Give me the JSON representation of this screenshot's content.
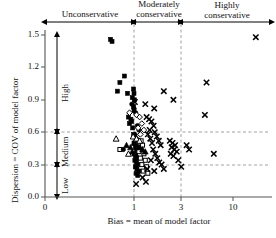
{
  "chart_data": {
    "type": "scatter",
    "title": "",
    "xlabel": "Bias = mean of model factor",
    "ylabel": "Dispersion = COV of model factor",
    "xscale": "log",
    "xticks": [
      0,
      1,
      3,
      10
    ],
    "xticklabels": [
      "0",
      "1",
      "3",
      "10"
    ],
    "yticks": [
      0.0,
      0.3,
      0.6,
      0.9,
      1.2,
      1.5
    ],
    "yticklabels": [
      "0.0",
      "0.3",
      "0.6",
      "0.9",
      "1.2",
      "1.5"
    ],
    "xlim": [
      0.35,
      20
    ],
    "ylim": [
      0.0,
      1.5
    ],
    "grid": "dashed gridlines at y=0.3, y=0.6 and x=1, x=3",
    "gridlines_x": [
      1,
      3
    ],
    "gridlines_y": [
      0.3,
      0.6
    ],
    "legend": "none",
    "zones_x": [
      {
        "label": "Unconservative",
        "range": [
          0.35,
          1
        ],
        "arrow": "double"
      },
      {
        "label": "Moderately\nconservative",
        "range": [
          1,
          3
        ],
        "arrow": "double"
      },
      {
        "label": "Highly\nconservative",
        "range": [
          3,
          20
        ],
        "arrow": "double"
      }
    ],
    "zones_y": [
      {
        "label": "Low",
        "range": [
          0.0,
          0.3
        ],
        "arrow": "double"
      },
      {
        "label": "Medium",
        "range": [
          0.3,
          0.6
        ],
        "arrow": "double"
      },
      {
        "label": "High",
        "range": [
          0.6,
          1.5
        ],
        "arrow": "double"
      }
    ],
    "series": [
      {
        "name": "filled-square",
        "marker": "filled-square",
        "points": [
          [
            0.58,
            1.46
          ],
          [
            0.6,
            1.44
          ],
          [
            0.72,
            1.06
          ],
          [
            0.8,
            1.12
          ],
          [
            0.68,
            0.98
          ],
          [
            0.86,
            0.96
          ],
          [
            0.96,
            0.92
          ],
          [
            0.99,
            1.0
          ],
          [
            1.0,
            0.96
          ],
          [
            1.01,
            0.9
          ],
          [
            0.99,
            0.84
          ],
          [
            1.0,
            0.8
          ],
          [
            0.88,
            0.74
          ],
          [
            0.93,
            0.72
          ],
          [
            0.95,
            0.7
          ],
          [
            0.9,
            0.68
          ],
          [
            0.97,
            0.64
          ],
          [
            0.99,
            0.58
          ],
          [
            1.02,
            0.56
          ],
          [
            1.05,
            0.52
          ],
          [
            1.0,
            0.5
          ],
          [
            1.03,
            0.46
          ],
          [
            1.06,
            0.44
          ],
          [
            1.0,
            0.4
          ],
          [
            1.04,
            0.38
          ],
          [
            1.08,
            0.36
          ],
          [
            1.02,
            0.34
          ],
          [
            1.06,
            0.32
          ],
          [
            1.1,
            0.3
          ],
          [
            1.03,
            0.28
          ],
          [
            1.07,
            0.26
          ],
          [
            1.12,
            0.24
          ],
          [
            1.05,
            0.22
          ],
          [
            1.09,
            0.2
          ]
        ]
      },
      {
        "name": "open-square",
        "marker": "open-square",
        "points": [
          [
            0.72,
            0.44
          ],
          [
            1.18,
            0.52
          ],
          [
            1.22,
            0.48
          ],
          [
            1.12,
            0.42
          ],
          [
            1.26,
            0.4
          ],
          [
            1.16,
            0.36
          ],
          [
            1.3,
            0.34
          ],
          [
            1.2,
            0.3
          ],
          [
            1.34,
            0.28
          ],
          [
            1.24,
            0.24
          ],
          [
            1.38,
            0.22
          ]
        ]
      },
      {
        "name": "filled-circle",
        "marker": "filled-circle",
        "points": [
          [
            0.95,
            0.86
          ],
          [
            1.0,
            0.82
          ],
          [
            1.04,
            0.78
          ],
          [
            0.78,
            0.44
          ],
          [
            1.08,
            0.66
          ],
          [
            1.12,
            0.62
          ],
          [
            1.02,
            0.58
          ],
          [
            1.06,
            0.54
          ]
        ]
      },
      {
        "name": "open-diamond",
        "marker": "open-diamond",
        "points": [
          [
            0.9,
            0.78
          ],
          [
            1.06,
            0.76
          ],
          [
            1.14,
            0.74
          ],
          [
            1.2,
            0.68
          ],
          [
            1.1,
            0.64
          ],
          [
            1.26,
            0.62
          ],
          [
            1.16,
            0.58
          ]
        ]
      },
      {
        "name": "filled-triangle",
        "marker": "filled-triangle",
        "points": [
          [
            0.84,
            0.48
          ],
          [
            0.92,
            0.46
          ],
          [
            1.0,
            0.5
          ],
          [
            1.08,
            0.48
          ],
          [
            1.14,
            0.46
          ],
          [
            1.22,
            0.44
          ],
          [
            1.3,
            0.42
          ],
          [
            0.96,
            0.42
          ],
          [
            1.04,
            0.4
          ]
        ]
      },
      {
        "name": "open-triangle",
        "marker": "open-triangle",
        "points": [
          [
            0.66,
            0.54
          ],
          [
            0.98,
            0.56
          ],
          [
            1.06,
            0.54
          ],
          [
            1.14,
            0.52
          ],
          [
            0.88,
            0.4
          ]
        ]
      },
      {
        "name": "x-marker",
        "marker": "x",
        "points": [
          [
            17.0,
            1.48
          ],
          [
            5.4,
            1.06
          ],
          [
            2.0,
            0.98
          ],
          [
            2.5,
            0.9
          ],
          [
            1.3,
            0.86
          ],
          [
            1.6,
            0.82
          ],
          [
            5.2,
            0.76
          ],
          [
            1.02,
            0.88
          ],
          [
            1.34,
            0.74
          ],
          [
            1.42,
            0.72
          ],
          [
            1.5,
            0.7
          ],
          [
            1.58,
            0.66
          ],
          [
            1.44,
            0.62
          ],
          [
            1.62,
            0.6
          ],
          [
            1.38,
            0.58
          ],
          [
            1.7,
            0.56
          ],
          [
            1.46,
            0.54
          ],
          [
            1.78,
            0.52
          ],
          [
            1.52,
            0.5
          ],
          [
            1.86,
            0.48
          ],
          [
            2.3,
            0.52
          ],
          [
            2.45,
            0.5
          ],
          [
            2.6,
            0.48
          ],
          [
            2.4,
            0.46
          ],
          [
            2.55,
            0.44
          ],
          [
            2.7,
            0.42
          ],
          [
            2.35,
            0.4
          ],
          [
            2.5,
            0.38
          ],
          [
            1.56,
            0.44
          ],
          [
            1.64,
            0.4
          ],
          [
            1.72,
            0.36
          ],
          [
            1.48,
            0.34
          ],
          [
            1.8,
            0.32
          ],
          [
            1.9,
            0.3
          ],
          [
            1.36,
            0.26
          ],
          [
            1.6,
            0.24
          ],
          [
            2.0,
            0.26
          ],
          [
            2.8,
            0.34
          ],
          [
            3.4,
            0.48
          ],
          [
            3.6,
            0.44
          ],
          [
            6.4,
            0.4
          ],
          [
            3.0,
            0.28
          ],
          [
            1.22,
            0.18
          ],
          [
            1.32,
            0.14
          ],
          [
            1.05,
            0.12
          ]
        ]
      }
    ]
  },
  "axes": {
    "xlabel": "Bias = mean of model factor",
    "ylabel": "Dispersion = COV of model factor",
    "xticklabels": [
      "0",
      "1",
      "3",
      "10"
    ],
    "yticklabels": [
      "0.0",
      "0.3",
      "0.6",
      "0.9",
      "1.2",
      "1.5"
    ]
  },
  "annotations": {
    "top_zones": [
      "Unconservative",
      "Moderately",
      "conservative",
      "Highly",
      "conservative"
    ],
    "left_zones": [
      "High",
      "Medium",
      "Low"
    ]
  }
}
